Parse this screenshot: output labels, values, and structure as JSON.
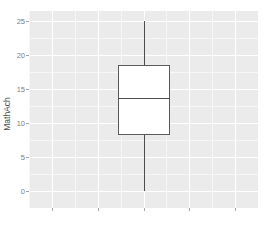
{
  "chart_data": {
    "type": "box",
    "title": "",
    "xlabel": "",
    "ylabel": "MathAch",
    "ylim": [
      -2.5,
      26.5
    ],
    "y_ticks": [
      0,
      5,
      10,
      15,
      20,
      25
    ],
    "y_tick_labels": [
      "0",
      "5",
      "10",
      "15",
      "20",
      "25"
    ],
    "y_minor_ticks": [
      2.5,
      7.5,
      12.5,
      17.5,
      22.5
    ],
    "x_ticks": [
      1,
      2,
      3,
      4,
      5
    ],
    "x_tick_labels": [
      "",
      "",
      "",
      "",
      ""
    ],
    "grid": true,
    "legend": "none",
    "categories": [
      "MathAch"
    ],
    "boxes": [
      {
        "label": "MathAch",
        "whisker_low": 0.0,
        "q1": 8.2,
        "median": 13.7,
        "q3": 18.6,
        "whisker_high": 25.0,
        "outliers": []
      }
    ]
  },
  "axis": {
    "y_title": "MathAch"
  },
  "style": {
    "panel_background": "#EBEBEB",
    "major_gridline_color": "#FFFFFF",
    "minor_gridline_color": "#F7F7F7",
    "box_fill": "#FFFFFF",
    "box_border": "#5A5A5A",
    "whisker_color": "#4D4D4D",
    "median_color": "#4D4D4D",
    "tick_label_color": "#808080",
    "axis_title_color": "#4D4D4D",
    "tick_mark_color": "#A6A6A6",
    "figure_background": "#FFFFFF"
  }
}
